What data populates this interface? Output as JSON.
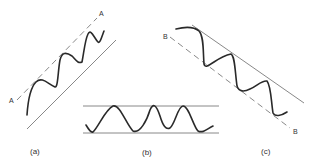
{
  "figure": {
    "panels": [
      {
        "id": "a",
        "caption": "(a)",
        "description": "Rising oscillation between two parallel diagonal lines",
        "dashed_line_label_start": "A",
        "dashed_line_label_end": "A"
      },
      {
        "id": "b",
        "caption": "(b)",
        "description": "Horizontal oscillation between two parallel horizontal lines"
      },
      {
        "id": "c",
        "caption": "(c)",
        "description": "Falling oscillation between two parallel diagonal lines",
        "dashed_line_label_start": "B",
        "dashed_line_label_end": "B"
      }
    ]
  },
  "colors": {
    "wave": "#2a2a2a",
    "guide": "#6a6a6a",
    "background": "#ffffff"
  }
}
